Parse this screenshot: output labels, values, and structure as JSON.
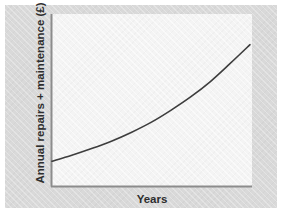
{
  "figure": {
    "background_color": "#ffffff",
    "panel_color": "#d9d9d9",
    "plot_area_color": "#f4f4f4",
    "axis_color": "#8c8c8c",
    "curve_color": "#3d3d3d"
  },
  "chart_data": {
    "type": "line",
    "title": "",
    "subtitle": "",
    "xlabel": "Years",
    "ylabel": "Annual repairs + maintenance (£)",
    "grid": false,
    "legend": null,
    "axis_ticks": {
      "x": [],
      "y": []
    },
    "xlim": [
      0,
      10
    ],
    "ylim": [
      0,
      10
    ],
    "series": [
      {
        "name": "Annual repairs + maintenance",
        "x": [
          0,
          1,
          2,
          3,
          4,
          5,
          6,
          7,
          8,
          9,
          10
        ],
        "y": [
          0.8,
          1.25,
          1.75,
          2.3,
          2.95,
          3.7,
          4.6,
          5.6,
          6.75,
          8.1,
          9.5
        ]
      }
    ],
    "annotations": []
  },
  "axis_label_x": "Years",
  "axis_label_y": "Annual repairs + maintenance (£)"
}
